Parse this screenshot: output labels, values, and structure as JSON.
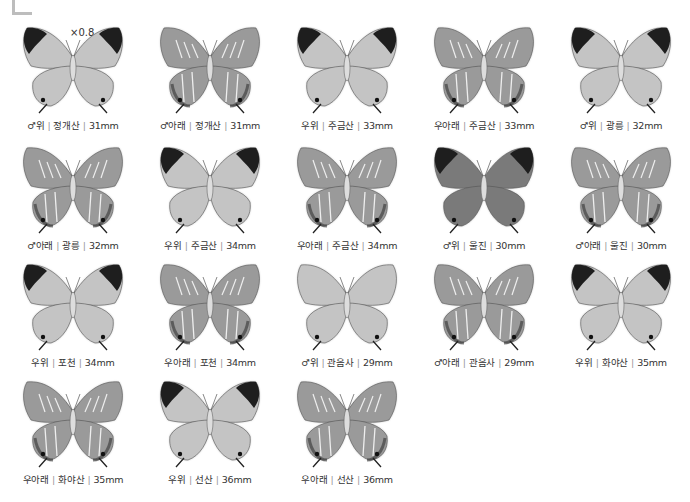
{
  "scale_label": "×0.8",
  "specimens": [
    {
      "sex": "♂",
      "side": "위",
      "locality": "정개산",
      "size": "31mm",
      "view": "upper"
    },
    {
      "sex": "♂",
      "side": "아래",
      "locality": "정개산",
      "size": "31mm",
      "view": "under"
    },
    {
      "sex": "우",
      "side": "위",
      "locality": "주금산",
      "size": "33mm",
      "view": "upper"
    },
    {
      "sex": "우",
      "side": "아래",
      "locality": "주금산",
      "size": "33mm",
      "view": "under"
    },
    {
      "sex": "♂",
      "side": "위",
      "locality": "광릉",
      "size": "32mm",
      "view": "upper"
    },
    {
      "sex": "♂",
      "side": "아래",
      "locality": "광릉",
      "size": "32mm",
      "view": "under"
    },
    {
      "sex": "우",
      "side": "위",
      "locality": "주금산",
      "size": "34mm",
      "view": "upper"
    },
    {
      "sex": "우",
      "side": "아래",
      "locality": "주금산",
      "size": "34mm",
      "view": "under"
    },
    {
      "sex": "♂",
      "side": "위",
      "locality": "울진",
      "size": "30mm",
      "view": "upper-dark"
    },
    {
      "sex": "♂",
      "side": "아래",
      "locality": "울진",
      "size": "30mm",
      "view": "under"
    },
    {
      "sex": "우",
      "side": "위",
      "locality": "포천",
      "size": "34mm",
      "view": "upper"
    },
    {
      "sex": "우",
      "side": "아래",
      "locality": "포천",
      "size": "34mm",
      "view": "under"
    },
    {
      "sex": "♂",
      "side": "위",
      "locality": "관음사",
      "size": "29mm",
      "view": "upper-plain"
    },
    {
      "sex": "♂",
      "side": "아래",
      "locality": "관음사",
      "size": "29mm",
      "view": "under"
    },
    {
      "sex": "우",
      "side": "위",
      "locality": "화야산",
      "size": "35mm",
      "view": "upper"
    },
    {
      "sex": "우",
      "side": "아래",
      "locality": "화야산",
      "size": "35mm",
      "view": "under"
    },
    {
      "sex": "우",
      "side": "위",
      "locality": "선산",
      "size": "36mm",
      "view": "upper"
    },
    {
      "sex": "우",
      "side": "아래",
      "locality": "선산",
      "size": "36mm",
      "view": "under"
    }
  ],
  "colors": {
    "wing_light": "#c8c8c8",
    "wing_mid": "#8a8a8a",
    "wing_dark": "#1e1e1e",
    "caption": "#333333"
  }
}
